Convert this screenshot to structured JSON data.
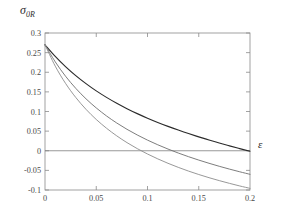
{
  "figure": {
    "background": "#ffffff",
    "frame_color": "#8a8a8a"
  },
  "labels": {
    "y_axis_symbol": "σ",
    "y_axis_subscript": "0R",
    "x_axis_symbol": "ε"
  },
  "chart_data": {
    "type": "line",
    "title": "",
    "subtitle": "",
    "xlabel": "ε",
    "ylabel": "σ₀R",
    "xlim": [
      0,
      0.2
    ],
    "ylim": [
      -0.1,
      0.3
    ],
    "grid": false,
    "legend": "none",
    "xticks": [
      0,
      0.05,
      0.1,
      0.15,
      0.2
    ],
    "xticklabels": [
      "0",
      "0.05",
      "0.1",
      "0.15",
      "0.2"
    ],
    "yticks": [
      -0.1,
      -0.05,
      0,
      0.05,
      0.1,
      0.15,
      0.2,
      0.25,
      0.3
    ],
    "yticklabels": [
      "-0.1",
      "-0.05",
      "0",
      "0.05",
      "0.1",
      "0.15",
      "0.2",
      "0.25",
      "0.3"
    ],
    "zero_line": 0,
    "x": [
      0,
      0.01,
      0.02,
      0.03,
      0.04,
      0.05,
      0.06,
      0.07,
      0.08,
      0.09,
      0.1,
      0.11,
      0.12,
      0.13,
      0.14,
      0.15,
      0.16,
      0.17,
      0.18,
      0.19,
      0.2
    ],
    "series": [
      {
        "name": "upper-curve",
        "color": "#2b2b2b",
        "width": 1.15,
        "zero_crossing": 0.156,
        "values": [
          0.27,
          0.2405,
          0.2145,
          0.1915,
          0.171,
          0.1525,
          0.136,
          0.121,
          0.1072,
          0.0946,
          0.083,
          0.0722,
          0.0621,
          0.0527,
          0.0438,
          0.0354,
          0.0274,
          0.0198,
          0.0125,
          0.0055,
          -0.0012
        ]
      },
      {
        "name": "middle-curve",
        "color": "#6e6e6e",
        "width": 0.9,
        "zero_crossing": 0.102,
        "values": [
          0.27,
          0.2265,
          0.19,
          0.159,
          0.1323,
          0.1091,
          0.0887,
          0.0707,
          0.0546,
          0.0402,
          0.0271,
          0.0152,
          0.0043,
          -0.0058,
          -0.0151,
          -0.0238,
          -0.0319,
          -0.0396,
          -0.0468,
          -0.0536,
          -0.06
        ]
      },
      {
        "name": "lower-curve",
        "color": "#8c8c8c",
        "width": 0.9,
        "zero_crossing": 0.078,
        "values": [
          0.27,
          0.2155,
          0.1718,
          0.1358,
          0.1055,
          0.0797,
          0.0574,
          0.0379,
          0.0207,
          0.0054,
          -0.0083,
          -0.0207,
          -0.032,
          -0.0423,
          -0.0518,
          -0.0605,
          -0.0686,
          -0.0761,
          -0.0831,
          -0.0897,
          -0.0958
        ]
      }
    ]
  }
}
